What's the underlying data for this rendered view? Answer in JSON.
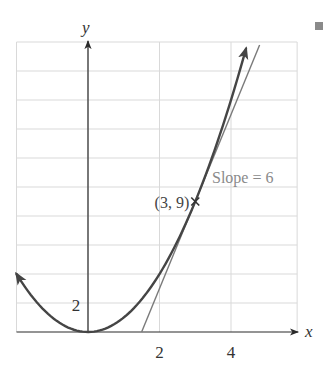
{
  "chart_data": {
    "type": "line",
    "title": "",
    "xlabel": "x",
    "ylabel": "y",
    "xlim": [
      -2,
      5.85
    ],
    "ylim": [
      0,
      20
    ],
    "grid": true,
    "x_grid_lines": [
      -2,
      0,
      2,
      4
    ],
    "y_grid_lines": [
      2,
      4,
      6,
      8,
      10,
      12,
      14,
      16,
      18,
      20
    ],
    "x_tick_labels": [
      {
        "value": 2,
        "label": "2"
      },
      {
        "value": 4,
        "label": "4"
      }
    ],
    "y_tick_labels": [
      {
        "value": 2,
        "label": "2"
      }
    ],
    "series": [
      {
        "name": "parabola",
        "equation": "y = x^2",
        "x_range": [
          -2,
          4.42
        ],
        "color": "#454545",
        "arrows": "both"
      },
      {
        "name": "tangent line",
        "equation": "y = 6x - 9",
        "x_range": [
          1.5,
          4.8
        ],
        "color": "#7a7a7a",
        "slope": 6
      }
    ],
    "annotations": [
      {
        "type": "point",
        "x": 3,
        "y": 9,
        "marker": "x",
        "label": "(3, 9)"
      },
      {
        "type": "text",
        "label": "Slope = 6",
        "x": 3.55,
        "y": 11.2,
        "color": "#8a8a8a"
      }
    ],
    "legend": null
  },
  "labels": {
    "x_axis": "x",
    "y_axis": "y",
    "point": "(3, 9)",
    "slope": "Slope = 6",
    "x_tick_2": "2",
    "x_tick_4": "4",
    "y_tick_2": "2"
  },
  "colors": {
    "grid": "#d9d9d9",
    "axis": "#2a2a2a",
    "curve": "#454545",
    "tangent": "#7a7a7a",
    "slope_text": "#8a8a8a",
    "corner_square": "#8a8a8a"
  }
}
